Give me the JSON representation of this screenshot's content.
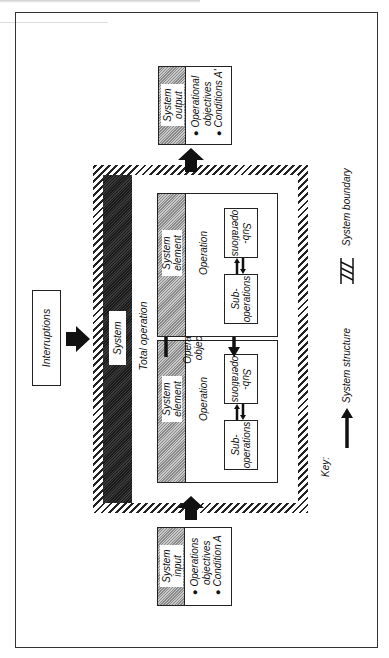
{
  "diagram": {
    "interruptions": "Interruptions",
    "system_bar_label": "System",
    "total_operation": "Total operation",
    "system_input": {
      "title_line1": "System",
      "title_line2": "input",
      "bullet1_line1": "Operations",
      "bullet1_line2": "objectives",
      "bullet2": "Condition A"
    },
    "system_output": {
      "title_line1": "System",
      "title_line2": "output",
      "bullet1_line1": "Operational",
      "bullet1_line2": "objectives",
      "bullet2": "Conditions A'"
    },
    "operations": [
      {
        "element_line1": "System",
        "element_line2": "element",
        "operation": "Operation",
        "sub1_line1": "Sub-",
        "sub1_line2": "operations",
        "sub2_line1": "Sub-",
        "sub2_line2": "operations"
      },
      {
        "element_line1": "System",
        "element_line2": "element",
        "operation": "Operation",
        "sub1_line1": "Sub-",
        "sub1_line2": "operations",
        "sub2_line1": "Sub-",
        "sub2_line2": "operations"
      }
    ],
    "operational_objectives_line1": "Operational",
    "operational_objectives_line2": "objectives",
    "key": {
      "title": "Key:",
      "structure_label": "System structure",
      "boundary_label": "System boundary"
    }
  }
}
